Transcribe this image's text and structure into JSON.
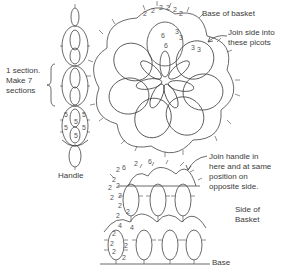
{
  "diagram": {
    "type": "tatting-pattern",
    "parts": [
      "handle",
      "base-of-basket",
      "side-of-basket"
    ]
  },
  "labels": {
    "section_line1": "1 section.",
    "section_line2": "Make 7",
    "section_line3": "sections",
    "handle": "Handle",
    "base_title": "Base of basket",
    "join_side_line1": "Join side into",
    "join_side_line2": "these picots",
    "join_handle_line1": "Join handle in",
    "join_handle_line2": "here and at same",
    "join_handle_line3": "position on",
    "join_handle_line4": "opposite side.",
    "side_line1": "Side of",
    "side_line2": "Basket",
    "base": "Base"
  },
  "stitch_counts": {
    "handle": [
      "5",
      "5",
      "5",
      "5",
      "5",
      "5"
    ],
    "base_arc": [
      "2",
      "2",
      "2",
      "2",
      "2",
      "2"
    ],
    "base_ring": [
      "3",
      "3",
      "6",
      "6",
      "3",
      "3"
    ],
    "side_upper": [
      "2",
      "6",
      "2",
      "6",
      "2",
      "2",
      "2",
      "2",
      "2",
      "2",
      "2",
      "2"
    ],
    "side_lower": [
      "4",
      "4",
      "2",
      "2",
      "2",
      "2",
      "2"
    ]
  },
  "colors": {
    "line": "#444444",
    "text": "#3a3a3a",
    "background": "#ffffff"
  }
}
